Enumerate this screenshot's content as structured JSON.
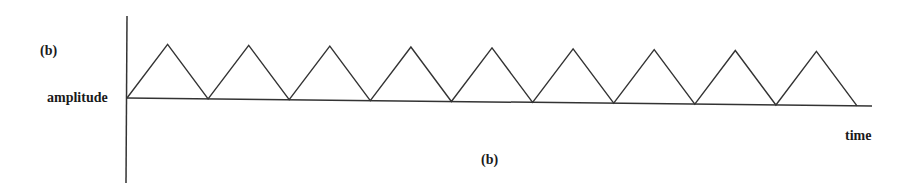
{
  "labels": {
    "panel_top": "(b)",
    "y_axis": "amplitude",
    "x_axis": "time",
    "caption": "(b)"
  },
  "chart_data": {
    "type": "line",
    "title": "(b)",
    "xlabel": "time",
    "ylabel": "amplitude",
    "x": [
      0,
      0.5,
      1,
      1.5,
      2,
      2.5,
      3,
      3.5,
      4,
      4.5,
      5,
      5.5,
      6,
      6.5,
      7,
      7.5,
      8,
      8.5,
      9
    ],
    "values": [
      0,
      1,
      0,
      1,
      0,
      1,
      0,
      1,
      0,
      1,
      0,
      1,
      0,
      1,
      0,
      1,
      0,
      1,
      0
    ],
    "cycles": 9,
    "grid": false,
    "legend": null
  }
}
